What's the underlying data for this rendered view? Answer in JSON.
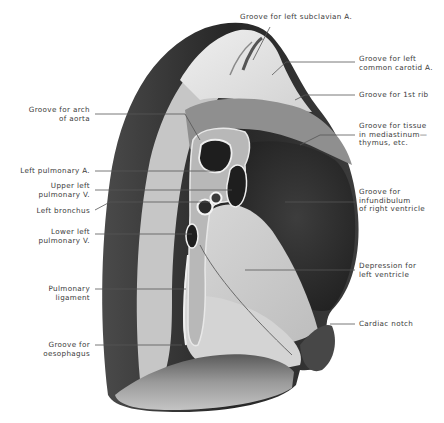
{
  "figure": {
    "colors": {
      "background": "#ffffff",
      "lung_dark": "#2e2e2e",
      "lung_mid": "#6a6a6a",
      "lung_light": "#c9c9c9",
      "lung_pale": "#e4e4e4",
      "label_text": "#3a3a3a",
      "leader_line": "#555555"
    }
  },
  "labels": {
    "left": [
      {
        "id": "groove-arch-aorta",
        "text": "Groove for arch\nof aorta"
      },
      {
        "id": "left-pulmonary-artery",
        "text": "Left pulmonary A."
      },
      {
        "id": "upper-left-pulmonary-vein",
        "text": "Upper left\npulmonary V."
      },
      {
        "id": "left-bronchus",
        "text": "Left bronchus"
      },
      {
        "id": "lower-left-pulmonary-vein",
        "text": "Lower left\npulmonary V."
      },
      {
        "id": "pulmonary-ligament",
        "text": "Pulmonary\nligament"
      },
      {
        "id": "groove-oesophagus",
        "text": "Groove for\noesophagus"
      }
    ],
    "right": [
      {
        "id": "groove-left-subclavian",
        "text": "Groove for left subclavian A."
      },
      {
        "id": "groove-left-common-carotid",
        "text": "Groove for left\ncommon carotid A."
      },
      {
        "id": "groove-1st-rib",
        "text": "Groove for 1st rib"
      },
      {
        "id": "groove-tissue-mediastinum",
        "text": "Groove for tissue\nin mediastinum—\nthymus, etc."
      },
      {
        "id": "groove-infundibulum",
        "text": "Groove for\ninfundibulum\nof right ventricle"
      },
      {
        "id": "depression-left-ventricle",
        "text": "Depression for\nleft ventricle"
      },
      {
        "id": "cardiac-notch",
        "text": "Cardiac notch"
      }
    ]
  }
}
